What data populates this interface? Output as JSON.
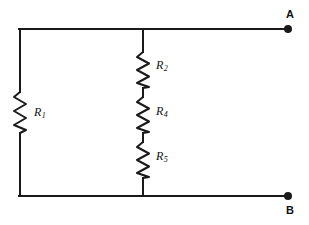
{
  "figure": {
    "type": "circuit-diagram",
    "background_color": "#ffffff",
    "line_color": "#1a1a1a",
    "line_width": 2
  },
  "resistors": [
    {
      "id": "R1",
      "label_letter": "R",
      "label_subscript": "1",
      "branch": "left",
      "symbol": "zigzag-resistor",
      "x": 20,
      "y_top": 92,
      "y_bottom": 133,
      "label_x": 34,
      "label_y": 106
    },
    {
      "id": "R2",
      "label_letter": "R",
      "label_subscript": "2",
      "branch": "middle",
      "symbol": "zigzag-resistor",
      "x": 143,
      "y_top": 52,
      "y_bottom": 88,
      "label_x": 156,
      "label_y": 59
    },
    {
      "id": "R4",
      "label_letter": "R",
      "label_subscript": "4",
      "branch": "middle",
      "symbol": "zigzag-resistor",
      "x": 143,
      "y_top": 97,
      "y_bottom": 133,
      "label_x": 156,
      "label_y": 105
    },
    {
      "id": "R5",
      "label_letter": "R",
      "label_subscript": "5",
      "branch": "middle",
      "symbol": "zigzag-resistor",
      "x": 143,
      "y_top": 142,
      "y_bottom": 178,
      "label_x": 156,
      "label_y": 150
    }
  ],
  "terminals": [
    {
      "id": "A",
      "label": "A",
      "dot_x": 288,
      "dot_y": 29,
      "dot_radius": 4,
      "label_x": 286,
      "label_y": 9
    },
    {
      "id": "B",
      "label": "B",
      "dot_x": 288,
      "dot_y": 196,
      "dot_radius": 4,
      "label_x": 286,
      "label_y": 205
    }
  ],
  "wires": {
    "left_rail_x": 20,
    "middle_branch_x": 143,
    "top_rail_y": 29,
    "bottom_rail_y": 196,
    "lead_end_x": 288
  }
}
